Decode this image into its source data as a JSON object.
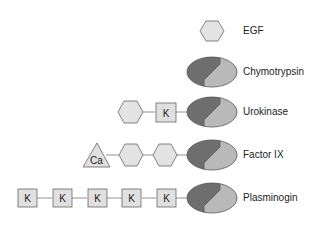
{
  "diagram": {
    "title": "",
    "colors": {
      "hexagon_fill": "#e3e3e3",
      "box_fill": "#e0e0e0",
      "stroke": "#666666",
      "protease_dark": "#6e6e6e",
      "protease_light": "#b9b9b9",
      "connector": "#777777",
      "text": "#222222"
    },
    "legend_symbols": {
      "hexagon": "EGF domain",
      "box_K": "Kringle domain",
      "triangle_Ca": "Ca (Gla) domain",
      "ellipse": "Serine protease domain"
    },
    "rows": [
      {
        "name": "EGF",
        "domains": [
          "hexagon"
        ]
      },
      {
        "name": "Chymotrypsin",
        "domains": [
          "protease"
        ]
      },
      {
        "name": "Urokinase",
        "domains": [
          "hexagon",
          "K",
          "protease"
        ]
      },
      {
        "name": "Factor IX",
        "domains": [
          "Ca",
          "hexagon",
          "hexagon",
          "protease"
        ]
      },
      {
        "name": "Plasminogin",
        "domains": [
          "K",
          "K",
          "K",
          "K",
          "K",
          "protease"
        ]
      }
    ],
    "box_label": "K",
    "triangle_label": "Ca"
  }
}
